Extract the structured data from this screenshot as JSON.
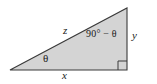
{
  "figure": {
    "kind": "right-triangle-diagram",
    "fill_color": "#d4d4d4",
    "stroke_color": "#3a3a3a",
    "background_color": "#ffffff",
    "label_color": "#1a1a1a"
  },
  "labels": {
    "hypotenuse": "z",
    "base": "x",
    "vertical": "y",
    "angle_lower_left": "θ",
    "angle_upper_right": "90° − θ"
  },
  "geometry": {
    "vertices": {
      "left": [
        10,
        70
      ],
      "bottom_right": [
        127,
        70
      ],
      "top_right": [
        127,
        8
      ]
    },
    "right_angle_marker": {
      "corner": "bottom-right",
      "size": 9
    }
  }
}
